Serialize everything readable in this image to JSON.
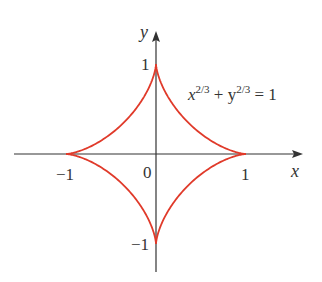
{
  "axes": {
    "x_label": "x",
    "y_label": "y",
    "origin_label": "0",
    "ticks": {
      "x_neg": "−1",
      "x_pos": "1",
      "y_pos": "1",
      "y_neg": "−1"
    }
  },
  "equation": {
    "x_base": "x",
    "x_exp": "2/3",
    "plus": " + ",
    "y_base": "y",
    "y_exp": "2/3",
    "rhs": " = 1"
  },
  "curve": {
    "name": "astroid",
    "equation": "x^(2/3) + y^(2/3) = 1",
    "color": "#e03a2a",
    "cusps": [
      [
        1,
        0
      ],
      [
        0,
        1
      ],
      [
        -1,
        0
      ],
      [
        0,
        -1
      ]
    ]
  },
  "colors": {
    "axis": "#333333",
    "curve": "#e03a2a",
    "background": "#ffffff"
  }
}
